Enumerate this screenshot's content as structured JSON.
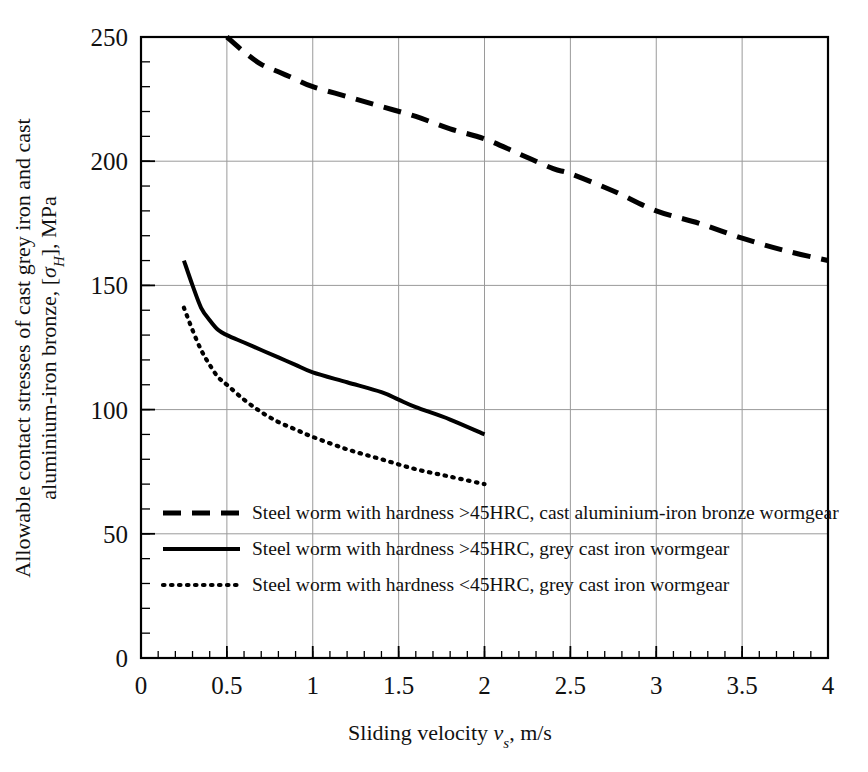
{
  "chart_data": {
    "type": "line",
    "title": "",
    "xlabel": "Sliding velocity v_s, m/s",
    "ylabel": "Allowable contact stresses of cast grey iron and cast aluminium-iron bronze, [σH], MPa",
    "xlim": [
      0,
      4
    ],
    "ylim": [
      0,
      250
    ],
    "xticks": [
      0,
      0.5,
      1,
      1.5,
      2,
      2.5,
      3,
      3.5,
      4
    ],
    "xtick_labels": [
      "0",
      "0.5",
      "1",
      "1.5",
      "2",
      "2.5",
      "3",
      "3.5",
      "4"
    ],
    "yticks": [
      0,
      50,
      100,
      150,
      200,
      250
    ],
    "ytick_labels": [
      "0",
      "50",
      "100",
      "150",
      "200",
      "250"
    ],
    "x_minor_tick_step": 0.1,
    "y_minor_tick_step": 10,
    "grid": true,
    "grid_color": "#9a9a9a",
    "legend_position": "inside-lower-left",
    "series": [
      {
        "name": "Steel worm with hardness >45HRC, cast aluminium-iron bronze wormgear",
        "style": "dashed",
        "color": "#000000",
        "points": [
          [
            0.5,
            250
          ],
          [
            0.6,
            244
          ],
          [
            0.7,
            239
          ],
          [
            0.8,
            236
          ],
          [
            0.9,
            233
          ],
          [
            1.0,
            230
          ],
          [
            1.2,
            226
          ],
          [
            1.4,
            222
          ],
          [
            1.6,
            218
          ],
          [
            1.8,
            213
          ],
          [
            2.0,
            209
          ],
          [
            2.2,
            203
          ],
          [
            2.4,
            197
          ],
          [
            2.5,
            195
          ],
          [
            2.75,
            188
          ],
          [
            3.0,
            180
          ],
          [
            3.25,
            175
          ],
          [
            3.5,
            169
          ],
          [
            3.75,
            164
          ],
          [
            4.0,
            160
          ]
        ]
      },
      {
        "name": "Steel worm with hardness >45HRC, grey cast iron wormgear",
        "style": "solid",
        "color": "#000000",
        "points": [
          [
            0.25,
            160
          ],
          [
            0.3,
            150
          ],
          [
            0.35,
            141
          ],
          [
            0.4,
            136
          ],
          [
            0.45,
            132
          ],
          [
            0.5,
            130
          ],
          [
            0.6,
            127
          ],
          [
            0.7,
            124
          ],
          [
            0.8,
            121
          ],
          [
            0.9,
            118
          ],
          [
            1.0,
            115
          ],
          [
            1.2,
            111
          ],
          [
            1.4,
            107
          ],
          [
            1.5,
            104
          ],
          [
            1.6,
            101
          ],
          [
            1.8,
            96
          ],
          [
            2.0,
            90
          ]
        ]
      },
      {
        "name": "Steel worm with hardness <45HRC, grey cast iron wormgear",
        "style": "dotted",
        "color": "#000000",
        "points": [
          [
            0.25,
            141
          ],
          [
            0.3,
            132
          ],
          [
            0.35,
            124
          ],
          [
            0.4,
            118
          ],
          [
            0.45,
            113
          ],
          [
            0.5,
            110
          ],
          [
            0.6,
            104
          ],
          [
            0.7,
            99
          ],
          [
            0.8,
            95
          ],
          [
            0.9,
            92
          ],
          [
            1.0,
            89
          ],
          [
            1.2,
            84
          ],
          [
            1.4,
            80
          ],
          [
            1.6,
            76
          ],
          [
            1.8,
            73
          ],
          [
            2.0,
            70
          ]
        ]
      }
    ],
    "legend_entries": [
      {
        "style": "dashed",
        "text_plain": "Steel worm with hardness >45HRC, cast aluminium-iron bronze wormgear"
      },
      {
        "style": "solid",
        "text_plain": "Steel worm with hardness >45HRC, grey cast iron wormgear"
      },
      {
        "style": "dotted",
        "text_plain": "Steel worm with hardness <45HRC, grey cast iron wormgear"
      }
    ]
  },
  "axis": {
    "x_title_pre": "Sliding velocity ",
    "x_title_var": "v",
    "x_title_sub": "s",
    "x_title_post": ", m/s",
    "y_title_line1": "Allowable contact stresses of cast grey iron and cast",
    "y_title_line2_pre": "aluminium-iron bronze, [",
    "y_title_line2_var": "σ",
    "y_title_line2_sub": "H",
    "y_title_line2_post": "], MPa"
  }
}
